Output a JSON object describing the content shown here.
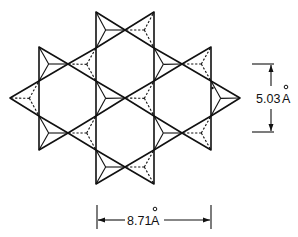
{
  "figure": {
    "labels": {
      "vertical_dimension": "5.03",
      "vertical_unit": "A",
      "horizontal_dimension": "8.71",
      "horizontal_unit": "A"
    },
    "colors": {
      "line": "#111111",
      "background": "#ffffff"
    },
    "tetrahedra": [
      {
        "id": "top-left",
        "pts": [
          [
            96,
            12
          ],
          [
            96,
            48
          ],
          [
            125,
            30
          ]
        ],
        "style": "solid"
      },
      {
        "id": "top-right",
        "pts": [
          [
            154,
            12
          ],
          [
            154,
            48
          ],
          [
            125,
            30
          ]
        ],
        "style": "dashed"
      },
      {
        "id": "r2-a",
        "pts": [
          [
            39,
            47
          ],
          [
            39,
            81
          ],
          [
            68,
            64
          ]
        ],
        "style": "solid"
      },
      {
        "id": "r2-b",
        "pts": [
          [
            96,
            48
          ],
          [
            96,
            81
          ],
          [
            68,
            64
          ]
        ],
        "style": "dashed"
      },
      {
        "id": "r2-c",
        "pts": [
          [
            154,
            48
          ],
          [
            154,
            81
          ],
          [
            182,
            64
          ]
        ],
        "style": "solid"
      },
      {
        "id": "r2-d",
        "pts": [
          [
            211,
            47
          ],
          [
            211,
            81
          ],
          [
            182,
            64
          ]
        ],
        "style": "dashed"
      },
      {
        "id": "left-tip",
        "pts": [
          [
            10,
            98
          ],
          [
            39,
            81
          ],
          [
            39,
            116
          ]
        ],
        "style": "dashed"
      },
      {
        "id": "center-left",
        "pts": [
          [
            96,
            81
          ],
          [
            96,
            116
          ],
          [
            125,
            98
          ]
        ],
        "style": "solid"
      },
      {
        "id": "center-right",
        "pts": [
          [
            154,
            81
          ],
          [
            154,
            116
          ],
          [
            125,
            98
          ]
        ],
        "style": "dashed"
      },
      {
        "id": "right-tip",
        "pts": [
          [
            240,
            98
          ],
          [
            211,
            81
          ],
          [
            211,
            116
          ]
        ],
        "style": "solid"
      },
      {
        "id": "r4-a",
        "pts": [
          [
            39,
            116
          ],
          [
            39,
            150
          ],
          [
            68,
            133
          ]
        ],
        "style": "solid"
      },
      {
        "id": "r4-b",
        "pts": [
          [
            96,
            116
          ],
          [
            96,
            150
          ],
          [
            68,
            133
          ]
        ],
        "style": "dashed"
      },
      {
        "id": "r4-c",
        "pts": [
          [
            154,
            116
          ],
          [
            154,
            150
          ],
          [
            182,
            133
          ]
        ],
        "style": "solid"
      },
      {
        "id": "r4-d",
        "pts": [
          [
            211,
            116
          ],
          [
            211,
            150
          ],
          [
            182,
            133
          ]
        ],
        "style": "dashed"
      },
      {
        "id": "bottom-left",
        "pts": [
          [
            96,
            150
          ],
          [
            96,
            184
          ],
          [
            125,
            167
          ]
        ],
        "style": "solid"
      },
      {
        "id": "bottom-right",
        "pts": [
          [
            154,
            150
          ],
          [
            154,
            184
          ],
          [
            125,
            167
          ]
        ],
        "style": "dashed"
      }
    ]
  }
}
